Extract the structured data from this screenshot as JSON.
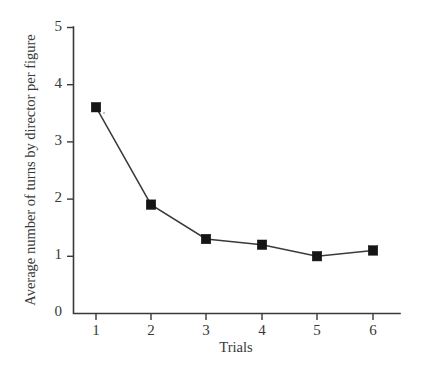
{
  "chart_data": {
    "type": "line",
    "title": "",
    "xlabel": "Trials",
    "ylabel": "Average number of turns by director per figure",
    "x": [
      1,
      2,
      3,
      4,
      5,
      6
    ],
    "values": [
      3.6,
      1.9,
      1.3,
      1.2,
      1.0,
      1.1
    ],
    "categories": [
      "1",
      "2",
      "3",
      "4",
      "5",
      "6"
    ],
    "xtick_labels": [
      "1",
      "2",
      "3",
      "4",
      "5",
      "6"
    ],
    "ytick_labels": [
      "0",
      "1",
      "2",
      "3",
      "4",
      "5"
    ],
    "ytick_values": [
      0,
      1,
      2,
      3,
      4,
      5
    ],
    "xlim": [
      0.55,
      6.5
    ],
    "ylim": [
      0,
      5
    ],
    "grid": false,
    "legend": false,
    "legend_position": "none",
    "marker": "filled-square",
    "line_color": "#3a3a3c",
    "marker_color": "#151515",
    "axis_color": "#39393a",
    "background_color": "#ffffff"
  },
  "axes": {
    "y_title": "Average number of turns by director per figure",
    "x_title": "Trials"
  }
}
